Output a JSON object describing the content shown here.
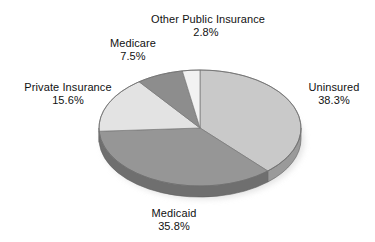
{
  "chart_data": {
    "type": "pie",
    "title": "",
    "subtitle": "",
    "xlabel": "",
    "ylabel": "",
    "legend_position": "none",
    "grid": false,
    "label_format": "name + percent",
    "start_angle_deg": 0,
    "direction": "clockwise",
    "style": "3d-elliptical",
    "total_percent": 100.0,
    "categories": [
      "Uninsured",
      "Medicaid",
      "Private Insurance",
      "Medicare",
      "Other Public Insurance"
    ],
    "values": [
      38.3,
      35.8,
      15.6,
      7.5,
      2.8
    ],
    "value_labels": [
      "38.3%",
      "35.8%",
      "15.6%",
      "7.5%",
      "2.8%"
    ],
    "colors": [
      "#c9c9c9",
      "#969696",
      "#e3e3e3",
      "#8d8d8d",
      "#f2f2f2"
    ],
    "slices": [
      {
        "name": "Uninsured",
        "value": 38.3,
        "value_label": "38.3%",
        "color": "#c9c9c9",
        "side_color": "#9a9a9a"
      },
      {
        "name": "Medicaid",
        "value": 35.8,
        "value_label": "35.8%",
        "color": "#969696",
        "side_color": "#6f6f6f"
      },
      {
        "name": "Private Insurance",
        "value": 15.6,
        "value_label": "15.6%",
        "color": "#e3e3e3",
        "side_color": "#b0b0b0"
      },
      {
        "name": "Medicare",
        "value": 7.5,
        "value_label": "7.5%",
        "color": "#8d8d8d",
        "side_color": "#6a6a6a"
      },
      {
        "name": "Other Public Insurance",
        "value": 2.8,
        "value_label": "2.8%",
        "color": "#f2f2f2",
        "side_color": "#c0c0c0"
      }
    ]
  },
  "labels": {
    "other_public": {
      "name": "Other Public Insurance",
      "value": "2.8%"
    },
    "medicare": {
      "name": "Medicare",
      "value": "7.5%"
    },
    "private": {
      "name": "Private Insurance",
      "value": "15.6%"
    },
    "uninsured": {
      "name": "Uninsured",
      "value": "38.3%"
    },
    "medicaid": {
      "name": "Medicaid",
      "value": "35.8%"
    }
  }
}
